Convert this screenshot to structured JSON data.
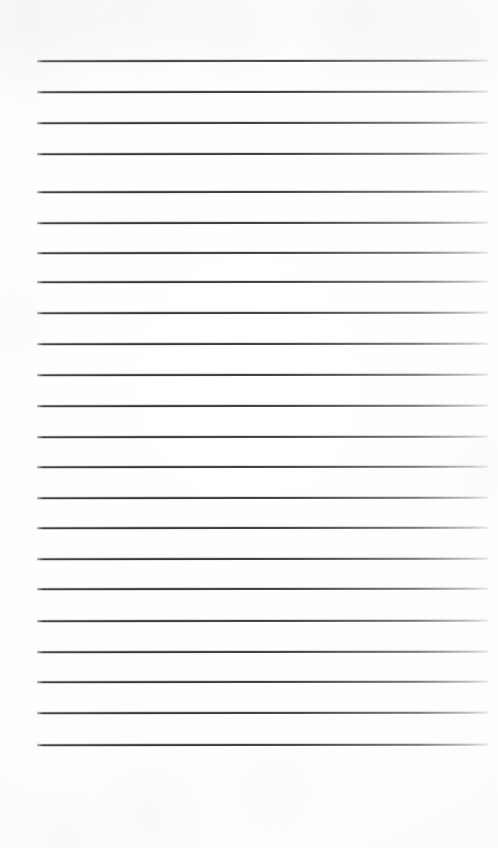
{
  "page": {
    "kind": "blank-lined-notepad-scan",
    "width": 498,
    "height": 848,
    "background_color": "#fdfdfd",
    "text_content": "",
    "line_color": "#3a3c40",
    "line_faded_color": "#c4c8ce"
  },
  "ruling": {
    "line_count": 23,
    "line_left_x": 37,
    "line_right_x": 488,
    "line_width": 451,
    "line_thickness": 2,
    "first_line_y": 60,
    "last_line_y": 744,
    "line_spacing": 31,
    "top_margin": 60,
    "bottom_margin": 104,
    "left_margin": 37,
    "right_margin": 10,
    "lines_y": [
      60,
      91,
      122,
      153,
      184,
      191,
      222,
      252,
      281,
      312,
      343,
      374,
      405,
      436,
      466,
      497,
      527,
      558,
      588,
      620,
      651,
      681,
      712,
      744
    ]
  },
  "rules": [
    {
      "index": 1,
      "y": 60,
      "x1": 37,
      "x2": 488,
      "content": ""
    },
    {
      "index": 2,
      "y": 91,
      "x1": 37,
      "x2": 488,
      "content": ""
    },
    {
      "index": 3,
      "y": 122,
      "x1": 37,
      "x2": 488,
      "content": ""
    },
    {
      "index": 4,
      "y": 153,
      "x1": 37,
      "x2": 488,
      "content": ""
    },
    {
      "index": 5,
      "y": 191,
      "x1": 37,
      "x2": 488,
      "content": ""
    },
    {
      "index": 6,
      "y": 222,
      "x1": 37,
      "x2": 488,
      "content": ""
    },
    {
      "index": 7,
      "y": 252,
      "x1": 37,
      "x2": 488,
      "content": ""
    },
    {
      "index": 8,
      "y": 281,
      "x1": 37,
      "x2": 488,
      "content": ""
    },
    {
      "index": 9,
      "y": 312,
      "x1": 37,
      "x2": 488,
      "content": ""
    },
    {
      "index": 10,
      "y": 343,
      "x1": 37,
      "x2": 488,
      "content": ""
    },
    {
      "index": 11,
      "y": 374,
      "x1": 37,
      "x2": 488,
      "content": ""
    },
    {
      "index": 12,
      "y": 405,
      "x1": 37,
      "x2": 488,
      "content": ""
    },
    {
      "index": 13,
      "y": 436,
      "x1": 37,
      "x2": 488,
      "content": ""
    },
    {
      "index": 14,
      "y": 466,
      "x1": 37,
      "x2": 488,
      "content": ""
    },
    {
      "index": 15,
      "y": 497,
      "x1": 37,
      "x2": 488,
      "content": ""
    },
    {
      "index": 16,
      "y": 527,
      "x1": 37,
      "x2": 488,
      "content": ""
    },
    {
      "index": 17,
      "y": 558,
      "x1": 37,
      "x2": 488,
      "content": ""
    },
    {
      "index": 18,
      "y": 588,
      "x1": 37,
      "x2": 488,
      "content": ""
    },
    {
      "index": 19,
      "y": 620,
      "x1": 37,
      "x2": 488,
      "content": ""
    },
    {
      "index": 20,
      "y": 651,
      "x1": 37,
      "x2": 488,
      "content": ""
    },
    {
      "index": 21,
      "y": 681,
      "x1": 37,
      "x2": 488,
      "content": ""
    },
    {
      "index": 22,
      "y": 712,
      "x1": 37,
      "x2": 488,
      "content": ""
    },
    {
      "index": 23,
      "y": 744,
      "x1": 37,
      "x2": 488,
      "content": ""
    }
  ]
}
